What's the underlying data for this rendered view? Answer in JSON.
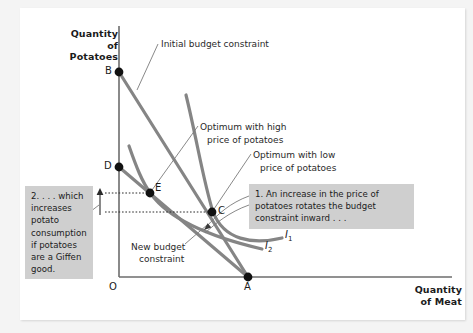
{
  "figure": {
    "type": "indifference-curve-budget-constraint",
    "topic": "Giffen good: increase in price of potatoes"
  },
  "axes": {
    "y_title": "Quantity of\nPotatoes",
    "y_title_line1": "Quantity of",
    "y_title_line2": "Potatoes",
    "x_title_line1": "Quantity",
    "x_title_line2": "of Meat",
    "origin_label": "O"
  },
  "points": [
    {
      "id": "B",
      "label": "B",
      "x": 119,
      "y": 72,
      "desc": "initial budget constraint potato intercept"
    },
    {
      "id": "D",
      "label": "D",
      "x": 119,
      "y": 167,
      "desc": "new budget constraint potato intercept"
    },
    {
      "id": "E",
      "label": "E",
      "x": 150,
      "y": 193,
      "desc": "optimum with high price of potatoes"
    },
    {
      "id": "C",
      "label": "C",
      "x": 212,
      "y": 212,
      "desc": "optimum with low price of potatoes"
    },
    {
      "id": "A",
      "label": "A",
      "x": 248,
      "y": 277,
      "desc": "meat intercept shared by both budget constraints"
    }
  ],
  "annotations": [
    {
      "id": "initial-budget-constraint",
      "text": "Initial budget constraint",
      "x": 161,
      "y": 44
    },
    {
      "id": "optimum-high-line1",
      "text": "Optimum with high",
      "x": 200,
      "y": 127
    },
    {
      "id": "optimum-high-line2",
      "text": "price of potatoes",
      "x": 207,
      "y": 140
    },
    {
      "id": "optimum-low-line1",
      "text": "Optimum with low",
      "x": 253,
      "y": 155
    },
    {
      "id": "optimum-low-line2",
      "text": "price of potatoes",
      "x": 260,
      "y": 168
    },
    {
      "id": "new-budget-line1",
      "text": "New budget",
      "x": 131,
      "y": 247
    },
    {
      "id": "new-budget-line2",
      "text": "constraint",
      "x": 139,
      "y": 259
    }
  ],
  "callouts": {
    "left": {
      "id": "callout-2",
      "text": "2. . . . which increases potato consumption if potatoes are a Giffen good."
    },
    "right": {
      "id": "callout-1",
      "text": "1. An increase in the price of potatoes rotates the budget constraint inward . . ."
    }
  },
  "curve_labels": [
    {
      "id": "I1",
      "base": "I",
      "sub": "1",
      "x": 285,
      "y": 234
    },
    {
      "id": "I2",
      "base": "I",
      "sub": "2",
      "x": 265,
      "y": 245
    }
  ],
  "colors": {
    "page_background": "#f4f4f4",
    "panel_background": "#ffffff",
    "curve_gray": "#808080",
    "axis_black": "#555555",
    "text_dark": "#1b1b1b",
    "callout_background": "#cfcfcf",
    "point_fill": "#111111",
    "leader_line": "#6b6b6b"
  }
}
